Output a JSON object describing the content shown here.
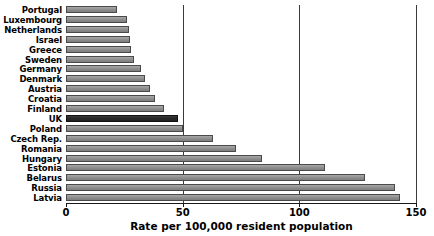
{
  "chart_data": {
    "type": "bar",
    "orientation": "horizontal",
    "title": "",
    "xlabel": "Rate per 100,000 resident population",
    "ylabel": "",
    "xlim": [
      0,
      150
    ],
    "xticks": [
      0,
      50,
      100,
      150
    ],
    "xtick_labels": [
      "0",
      "50",
      "100",
      "150"
    ],
    "grid": true,
    "grid_axis": "x",
    "legend": null,
    "highlight_category": "UK",
    "colors": {
      "bar_fill": "#8e8e8e",
      "bar_edge": "#4a4a4a",
      "highlight_fill": "#262626",
      "highlight_edge": "#111111",
      "gridline": "#3a3a3a",
      "axis": "#1a1a1a",
      "text": "#000000",
      "background": "#ffffff"
    },
    "categories": [
      "Portugal",
      "Luxembourg",
      "Netherlands",
      "Israel",
      "Greece",
      "Sweden",
      "Germany",
      "Denmark",
      "Austria",
      "Croatia",
      "Finland",
      "UK",
      "Poland",
      "Czech Rep.",
      "Romania",
      "Hungary",
      "Estonia",
      "Belarus",
      "Russia",
      "Latvia"
    ],
    "values": [
      22,
      26,
      27,
      27.5,
      28,
      29,
      32,
      34,
      36,
      38,
      42,
      48,
      50,
      63,
      73,
      84,
      111,
      128,
      141,
      143
    ]
  }
}
